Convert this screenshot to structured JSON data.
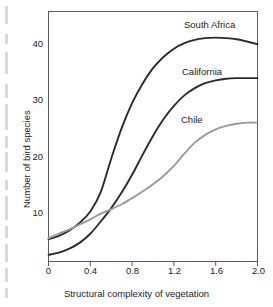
{
  "chart_data": {
    "type": "line",
    "title": "",
    "xlabel": "Structural complexity of vegetation",
    "ylabel": "Number of bird species",
    "xlim": [
      0,
      2.0
    ],
    "ylim": [
      0,
      45
    ],
    "xticks": [
      "0",
      "0.4",
      "0.8",
      "1.2",
      "1.6",
      "2.0"
    ],
    "xtick_values": [
      0,
      0.4,
      0.8,
      1.2,
      1.6,
      2.0
    ],
    "yticks": [
      "10",
      "20",
      "30",
      "40"
    ],
    "ytick_values": [
      10,
      20,
      30,
      40
    ],
    "grid": false,
    "legend_position": "inline-labels",
    "x": [
      0,
      0.1,
      0.2,
      0.3,
      0.4,
      0.5,
      0.6,
      0.7,
      0.8,
      0.9,
      1.0,
      1.1,
      1.2,
      1.3,
      1.4,
      1.5,
      1.6,
      1.7,
      1.8,
      1.9,
      2.0
    ],
    "series": [
      {
        "name": "South Africa",
        "color": "#2b2b2b",
        "values": [
          4.0,
          4.6,
          5.6,
          7.0,
          9.0,
          12.5,
          18.5,
          24.0,
          28.5,
          32.0,
          34.8,
          36.8,
          38.3,
          39.3,
          39.9,
          40.2,
          40.3,
          40.2,
          40.0,
          39.6,
          39.1
        ],
        "label_x": 1.47,
        "label_y": 43.5
      },
      {
        "name": "California",
        "color": "#2b2b2b",
        "values": [
          1.2,
          1.6,
          2.3,
          3.4,
          5.0,
          7.2,
          9.6,
          12.4,
          15.6,
          19.2,
          22.6,
          25.6,
          28.0,
          29.9,
          31.2,
          32.1,
          32.6,
          32.9,
          33.0,
          33.0,
          33.0
        ],
        "label_x": 1.45,
        "label_y": 35.2
      },
      {
        "name": "Chile",
        "color": "#9a9a9a",
        "values": [
          4.2,
          5.0,
          5.8,
          6.7,
          7.6,
          8.6,
          9.4,
          10.3,
          11.4,
          12.6,
          13.9,
          15.4,
          17.2,
          19.4,
          21.4,
          22.8,
          23.8,
          24.4,
          24.8,
          25.0,
          25.0
        ],
        "label_x": 1.44,
        "label_y": 26.6
      }
    ]
  },
  "axes": {
    "x_title": "Structural complexity of vegetation",
    "y_title": "Number of bird species",
    "x_tick_0": "0",
    "x_tick_1": "0.4",
    "x_tick_2": "0.8",
    "x_tick_3": "1.2",
    "x_tick_4": "1.6",
    "x_tick_5": "2.0",
    "y_tick_0": "10",
    "y_tick_1": "20",
    "y_tick_2": "30",
    "y_tick_3": "40"
  },
  "series_labels": {
    "south_africa": "South Africa",
    "california": "California",
    "chile": "Chile"
  },
  "colors": {
    "dark_curve": "#2b2b2b",
    "gray_curve": "#9a9a9a",
    "frame": "#5a5a5a",
    "text": "#1c1c1c",
    "background": "#ffffff"
  }
}
